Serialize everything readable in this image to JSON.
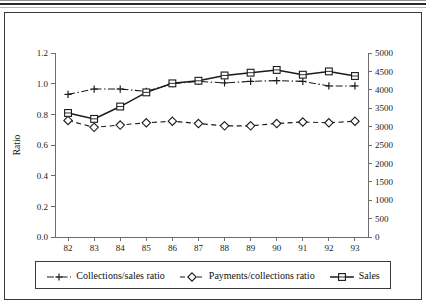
{
  "figure": {
    "caption_ghost": "",
    "frame_color": "#3a3a3a"
  },
  "chart_data": {
    "type": "line",
    "title": "",
    "subtitle": "",
    "xlabel": "",
    "ylabel": "Ratio",
    "y2label": "",
    "categories": [
      "82",
      "83",
      "84",
      "85",
      "86",
      "87",
      "88",
      "89",
      "90",
      "91",
      "92",
      "93"
    ],
    "x": [
      82,
      83,
      84,
      85,
      86,
      87,
      88,
      89,
      90,
      91,
      92,
      93
    ],
    "ylim": [
      0.0,
      1.2
    ],
    "y2lim": [
      0,
      5000
    ],
    "yticks": [
      "0.0",
      "0.2",
      "0.4",
      "0.6",
      "0.8",
      "1.0",
      "1.2"
    ],
    "ytick_values": [
      0.0,
      0.2,
      0.4,
      0.6,
      0.8,
      1.0,
      1.2
    ],
    "y2ticks": [
      "0",
      "500",
      "1000",
      "1500",
      "2000",
      "2500",
      "3000",
      "3500",
      "4000",
      "4500",
      "5000"
    ],
    "y2tick_values": [
      0,
      500,
      1000,
      1500,
      2000,
      2500,
      3000,
      3500,
      4000,
      4500,
      5000
    ],
    "grid": false,
    "legend_position": "bottom",
    "series": [
      {
        "name": "Collections/sales ratio",
        "axis": "left",
        "marker": "plus",
        "linestyle": "dashdot",
        "color": "#1a1a1a",
        "values": [
          0.93,
          0.965,
          0.965,
          0.95,
          1.0,
          1.015,
          1.005,
          1.015,
          1.02,
          1.015,
          0.985,
          0.985
        ]
      },
      {
        "name": "Payments/collections ratio",
        "axis": "left",
        "marker": "diamond",
        "linestyle": "dashed",
        "color": "#1a1a1a",
        "values": [
          0.76,
          0.715,
          0.73,
          0.745,
          0.755,
          0.74,
          0.725,
          0.725,
          0.74,
          0.75,
          0.745,
          0.755
        ]
      },
      {
        "name": "Sales",
        "axis": "right",
        "marker": "square",
        "linestyle": "solid",
        "color": "#1a1a1a",
        "values": [
          3370,
          3210,
          3545,
          3930,
          4175,
          4245,
          4390,
          4465,
          4540,
          4410,
          4500,
          4375
        ]
      }
    ]
  },
  "legend": {
    "items": [
      {
        "label": "Collections/sales ratio",
        "marker": "plus-marker",
        "linestyle": "dashdot"
      },
      {
        "label": "Payments/collections ratio",
        "marker": "diamond-marker",
        "linestyle": "dashed"
      },
      {
        "label": "Sales",
        "marker": "square-marker",
        "linestyle": "solid"
      }
    ]
  }
}
